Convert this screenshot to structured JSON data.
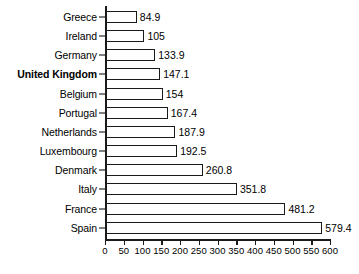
{
  "chart_data": {
    "type": "bar",
    "orientation": "horizontal",
    "title": "",
    "subtitle": "",
    "xlabel": "",
    "ylabel": "",
    "categories": [
      "Greece",
      "Ireland",
      "Germany",
      "United Kingdom",
      "Belgium",
      "Portugal",
      "Netherlands",
      "Luxembourg",
      "Denmark",
      "Italy",
      "France",
      "Spain"
    ],
    "values": [
      84.9,
      105,
      133.9,
      147.1,
      154,
      167.4,
      187.9,
      192.5,
      260.8,
      351.8,
      481.2,
      579.4
    ],
    "value_labels": [
      "84.9",
      "105",
      "133.9",
      "147.1",
      "154",
      "167.4",
      "187.9",
      "192.5",
      "260.8",
      "351.8",
      "481.2",
      "579.4"
    ],
    "highlighted_category": "United Kingdom",
    "xlim": [
      0,
      600
    ],
    "xticks": [
      0,
      50,
      100,
      150,
      200,
      250,
      300,
      350,
      400,
      450,
      500,
      550,
      600
    ],
    "xtick_labels": [
      "0",
      "50",
      "100",
      "150",
      "200",
      "250",
      "300",
      "350",
      "400",
      "450",
      "500",
      "550",
      "600"
    ],
    "grid": false,
    "legend": false,
    "bar_fill_color": "#ffffff",
    "bar_edge_color": "#1a1a1a",
    "background_color": "#ffffff",
    "text_color": "#000000"
  }
}
